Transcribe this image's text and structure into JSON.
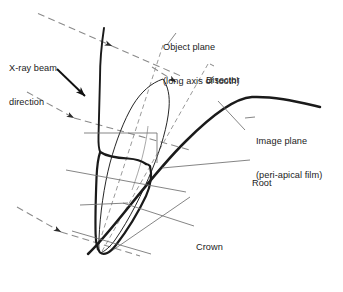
{
  "figure": {
    "domain": "diagram",
    "background_color": "#ffffff",
    "ink_color": "#1a1a1a",
    "dash_color": "#8a8a8a",
    "thin_color": "#6f6f6f"
  },
  "labels": {
    "xray": {
      "line1": "X-ray beam",
      "line2": "direction"
    },
    "object_plane": {
      "line1": "Object plane",
      "line2": "(long axis of tooth)"
    },
    "bisector": {
      "line1": "Bisector"
    },
    "image_plane": {
      "line1": "Image plane",
      "line2": "(peri-apical film)"
    },
    "root": {
      "line1": "Root"
    },
    "crown": {
      "line1": "Crown"
    }
  },
  "icons": {
    "beam_arrow": "arrowhead-icon",
    "pointer_arrow": "solid-arrow-icon"
  },
  "geometry": {
    "xray_beams": [
      {
        "name": "beam-upper",
        "x1": 38,
        "y1": 14,
        "x2": 175,
        "y2": 74,
        "arrow_at": 0.52
      },
      {
        "name": "beam-middle",
        "x1": 28,
        "y1": 93,
        "x2": 185,
        "y2": 140,
        "arrow_at": 0.55
      },
      {
        "name": "beam-lower",
        "x1": 18,
        "y1": 208,
        "x2": 135,
        "y2": 253,
        "arrow_at": 0.52
      }
    ],
    "pointer_arrow": {
      "x1": 58,
      "y1": 70,
      "x2": 86,
      "y2": 97
    },
    "object_plane_line": {
      "x1": 161,
      "y1": 46,
      "x2": 96,
      "y2": 252
    },
    "bisector_line": {
      "x1": 206,
      "y1": 66,
      "x2": 100,
      "y2": 252
    },
    "tooth_apex": {
      "x": 99,
      "y": 250
    },
    "tooth_top": {
      "x": 163,
      "y": 78
    },
    "image_plane_arc": {
      "start_x": 90,
      "start_y": 253,
      "peak_x": 252,
      "peak_y": 98,
      "end_x": 320,
      "end_y": 107
    }
  }
}
